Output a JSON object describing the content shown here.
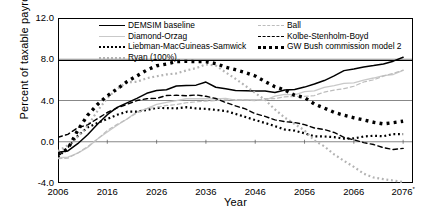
{
  "chart_data": {
    "type": "line",
    "title": "",
    "xlabel": "Year",
    "ylabel": "Percent of taxable payrolls",
    "xlim": [
      2006,
      2078
    ],
    "ylim": [
      -4.0,
      12.0
    ],
    "grid": true,
    "legend_position": "top-inside",
    "xticks": [
      "2006",
      "2016",
      "2026",
      "2036",
      "2046",
      "2056",
      "2066",
      "2076"
    ],
    "xtick_values": [
      2006,
      2016,
      2026,
      2036,
      2046,
      2056,
      2066,
      2076
    ],
    "xtick_note": "*",
    "yticks": [
      "12.0",
      "8.0",
      "4.0",
      "0.0",
      "-4.0"
    ],
    "ytick_values": [
      12.0,
      8.0,
      4.0,
      0.0,
      -4.0
    ],
    "x": [
      2006,
      2008,
      2010,
      2012,
      2014,
      2016,
      2018,
      2020,
      2022,
      2024,
      2026,
      2028,
      2030,
      2032,
      2034,
      2036,
      2038,
      2040,
      2042,
      2044,
      2046,
      2048,
      2050,
      2052,
      2054,
      2056,
      2058,
      2060,
      2062,
      2064,
      2066,
      2068,
      2070,
      2072,
      2074,
      2076
    ],
    "series": [
      {
        "name": "DEMSIM baseline",
        "style": "solid",
        "color": "#000000",
        "width": 1.5,
        "values": [
          -1.2,
          -0.9,
          -0.3,
          0.6,
          1.6,
          2.5,
          3.3,
          3.9,
          4.3,
          4.7,
          5.0,
          5.2,
          5.4,
          5.5,
          5.4,
          5.6,
          5.2,
          5.0,
          4.9,
          4.8,
          4.8,
          4.8,
          4.9,
          5.2,
          5.2,
          5.4,
          5.8,
          6.1,
          6.5,
          6.7,
          6.9,
          7.2,
          7.3,
          7.5,
          7.7,
          8.0
        ]
      },
      {
        "name": "Diamond-Orzag",
        "style": "solid",
        "color": "#c9c9c9",
        "width": 1.3,
        "values": [
          -1.5,
          -1.4,
          -1.0,
          -0.4,
          0.3,
          1.0,
          1.7,
          2.3,
          2.8,
          3.2,
          3.5,
          3.7,
          3.9,
          4.0,
          4.1,
          4.3,
          4.3,
          4.2,
          4.1,
          4.1,
          4.1,
          4.2,
          4.3,
          4.4,
          4.5,
          4.7,
          4.9,
          5.1,
          5.4,
          5.6,
          5.8,
          6.1,
          6.3,
          6.5,
          6.7,
          7.0
        ]
      },
      {
        "name": "Liebman-MacGuineas-Samwick",
        "style": "dotted",
        "color": "#000000",
        "width": 2.2,
        "values": [
          -1.3,
          -0.6,
          0.5,
          1.2,
          1.7,
          2.1,
          2.5,
          2.8,
          3.0,
          3.2,
          3.3,
          3.3,
          3.4,
          3.4,
          3.3,
          3.2,
          3.0,
          2.8,
          2.6,
          2.3,
          2.0,
          1.8,
          1.5,
          1.3,
          1.1,
          0.9,
          0.7,
          0.6,
          0.5,
          0.5,
          0.4,
          0.5,
          0.5,
          0.5,
          0.6,
          0.6
        ]
      },
      {
        "name": "Ryan (100%)",
        "style": "dotted",
        "color": "#b3b3b3",
        "width": 2.2,
        "values": [
          -1.0,
          -0.4,
          0.5,
          1.6,
          3.0,
          4.3,
          5.3,
          5.8,
          6.0,
          6.1,
          6.2,
          6.4,
          6.6,
          6.9,
          7.1,
          7.4,
          7.3,
          6.9,
          6.3,
          5.6,
          4.8,
          4.1,
          3.3,
          2.5,
          1.7,
          0.9,
          0.1,
          -0.6,
          -1.3,
          -2.0,
          -2.6,
          -3.0,
          -3.3,
          -3.5,
          -3.7,
          -3.9
        ]
      },
      {
        "name": "Ball",
        "style": "dashed",
        "color": "#bdbdbd",
        "width": 1.2,
        "values": [
          -1.6,
          -1.5,
          -1.1,
          -0.5,
          0.2,
          0.9,
          1.6,
          2.2,
          2.7,
          3.1,
          3.4,
          3.6,
          3.8,
          3.9,
          4.0,
          4.1,
          4.1,
          4.0,
          3.9,
          3.9,
          3.9,
          4.0,
          4.1,
          4.2,
          4.3,
          4.4,
          4.6,
          4.9,
          5.1,
          5.3,
          5.5,
          5.8,
          6.0,
          6.2,
          6.5,
          6.8
        ]
      },
      {
        "name": "Kolbe-Stenholm-Boyd",
        "style": "dashed",
        "color": "#000000",
        "width": 1.4,
        "values": [
          0.4,
          0.7,
          1.2,
          1.8,
          2.4,
          2.9,
          3.3,
          3.7,
          4.0,
          4.2,
          4.3,
          4.3,
          4.4,
          4.4,
          4.4,
          4.3,
          4.1,
          3.8,
          3.5,
          3.2,
          2.8,
          2.5,
          2.2,
          2.0,
          1.9,
          1.6,
          1.3,
          1.0,
          0.7,
          0.3,
          0.0,
          -0.2,
          -0.4,
          -0.5,
          -0.6,
          -0.6
        ]
      },
      {
        "name": "GW Bush commission model 2",
        "style": "dotted",
        "color": "#000000",
        "width": 3.4,
        "values": [
          -1.2,
          -0.5,
          1.3,
          2.6,
          3.6,
          4.4,
          5.1,
          5.7,
          6.3,
          6.8,
          7.2,
          7.6,
          7.8,
          7.9,
          7.8,
          7.9,
          7.6,
          7.3,
          7.0,
          6.6,
          6.2,
          5.8,
          5.3,
          4.9,
          4.5,
          4.1,
          3.7,
          3.3,
          3.0,
          2.7,
          2.4,
          2.2,
          2.0,
          1.9,
          1.8,
          1.8
        ]
      }
    ]
  },
  "legend": {
    "left_column": [
      {
        "label": "DEMSIM baseline",
        "swatch": "sw-solid-black"
      },
      {
        "label": "Diamond-Orzag",
        "swatch": "sw-solid-gray"
      },
      {
        "label": "Liebman-MacGuineas-Samwick",
        "swatch": "sw-dot-black"
      },
      {
        "label": "Ryan (100%)",
        "swatch": "sw-dot-gray"
      }
    ],
    "right_column": [
      {
        "label": "Ball",
        "swatch": "sw-dash-gray"
      },
      {
        "label": "Kolbe-Stenholm-Boyd",
        "swatch": "sw-dash-black"
      },
      {
        "label": "GW Bush commission model 2",
        "swatch": "sw-thick-dot"
      }
    ]
  }
}
